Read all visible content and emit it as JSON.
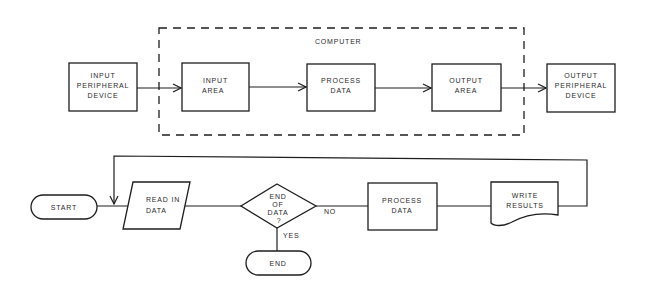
{
  "diagrams": {
    "system": {
      "container_label": "COMPUTER",
      "nodes": [
        {
          "id": "input-peripheral",
          "lines": [
            "INPUT",
            "PERIPHERAL",
            "DEVICE"
          ]
        },
        {
          "id": "input-area",
          "lines": [
            "INPUT",
            "AREA"
          ]
        },
        {
          "id": "process-data",
          "lines": [
            "PROCESS",
            "DATA"
          ]
        },
        {
          "id": "output-area",
          "lines": [
            "OUTPUT",
            "AREA"
          ]
        },
        {
          "id": "output-peripheral",
          "lines": [
            "OUTPUT",
            "PERIPHERAL",
            "DEVICE"
          ]
        }
      ]
    },
    "flowchart": {
      "nodes": [
        {
          "id": "start",
          "shape": "terminal",
          "lines": [
            "START"
          ]
        },
        {
          "id": "read-in-data",
          "shape": "parallelogram",
          "lines": [
            "READ  IN",
            "DATA"
          ]
        },
        {
          "id": "end-of-data",
          "shape": "decision",
          "lines": [
            "END",
            "OF",
            "DATA",
            "?"
          ]
        },
        {
          "id": "process-data",
          "shape": "process",
          "lines": [
            "PROCESS",
            "DATA"
          ]
        },
        {
          "id": "write-results",
          "shape": "document",
          "lines": [
            "WRITE",
            "RESULTS"
          ]
        },
        {
          "id": "end",
          "shape": "terminal",
          "lines": [
            "END"
          ]
        }
      ],
      "edge_labels": {
        "no": "NO",
        "yes": "YES"
      }
    }
  }
}
